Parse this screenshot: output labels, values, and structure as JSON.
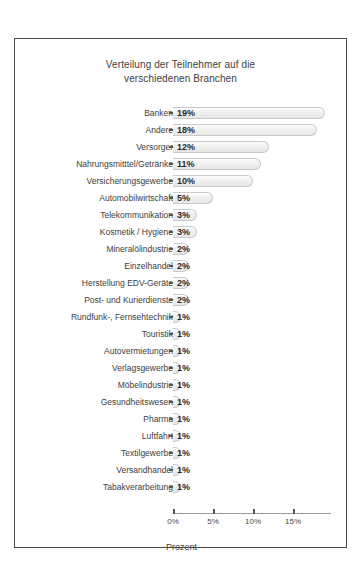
{
  "chart_data": {
    "type": "bar",
    "orientation": "horizontal",
    "title": "Verteilung der Teilnehmer auf die verschiedenen Branchen",
    "title_lines": [
      "Verteilung der Teilnehmer auf die",
      "verschiedenen Branchen"
    ],
    "xlabel": "Prozent",
    "ylabel": "",
    "xlim": [
      0,
      18
    ],
    "xticks": [
      0,
      5,
      10,
      15
    ],
    "xtick_labels": [
      "0%",
      "5%",
      "10%",
      "15%"
    ],
    "grid": false,
    "legend": null,
    "value_suffix": "%",
    "categories": [
      "Banken",
      "Andere",
      "Versorger",
      "Nahrungsmitttel/Getränke",
      "Versicherungsgewerbe",
      "Automobilwirtschaft",
      "Telekommunikation",
      "Kosmetik / Hygiene",
      "Mineralölindustrie",
      "Einzelhandel",
      "Herstellung EDV-Geräte",
      "Post- und Kurierdienste",
      "Rundfunk-, Fernsehtechnik",
      "Touristik",
      "Autovermietungen",
      "Verlagsgewerbe",
      "Möbelindustrie",
      "Gesundheitswesen",
      "Pharma",
      "Luftfahrt",
      "Textilgewerbe",
      "Versandhandel",
      "Tabakverarbeitung"
    ],
    "values": [
      19,
      18,
      12,
      11,
      10,
      5,
      3,
      3,
      2,
      2,
      2,
      2,
      1,
      1,
      1,
      1,
      1,
      1,
      1,
      1,
      1,
      1,
      1
    ],
    "data_labels": [
      "19%",
      "18%",
      "12%",
      "11%",
      "10%",
      "5%",
      "3%",
      "3%",
      "2%",
      "2%",
      "2%",
      "2%",
      "1%",
      "1%",
      "1%",
      "1%",
      "1%",
      "1%",
      "1%",
      "1%",
      "1%",
      "1%",
      "1%"
    ],
    "colors": {
      "bar_fill": "#eeeeee",
      "bar_border": "#c9c9c9",
      "frame": "#4a4a4a",
      "text": "#3d3d3d",
      "background": "#ffffff"
    }
  }
}
